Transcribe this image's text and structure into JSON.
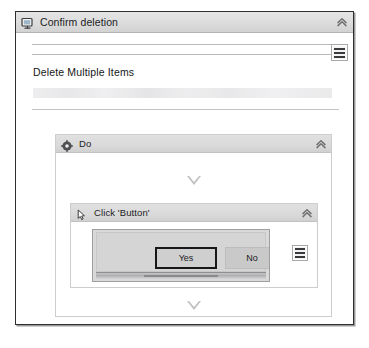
{
  "window": {
    "title": "Confirm deletion",
    "title_icon": "monitor-window-icon",
    "collapse_icon": "double-chevron-up-icon",
    "menu_icon": "hamburger-menu-icon"
  },
  "dialog": {
    "heading": "Delete Multiple Items",
    "description_placeholder": ""
  },
  "do_block": {
    "title": "Do",
    "icon": "move-gear-icon",
    "collapse_icon": "double-chevron-up-icon",
    "drop_indicator_upper": "drop-triangle-icon",
    "drop_indicator_lower": "drop-triangle-icon"
  },
  "click_block": {
    "title": "Click 'Button'",
    "icon": "mouse-cursor-icon",
    "collapse_icon": "double-chevron-up-icon",
    "menu_icon": "hamburger-menu-icon",
    "screenshot": {
      "buttons": [
        {
          "label": "Yes",
          "state": "focused"
        },
        {
          "label": "No",
          "state": "normal"
        }
      ]
    }
  },
  "colors": {
    "window_border": "#2e2e30",
    "titlebar": "#dcdcdc",
    "block_header": "#dadada",
    "focus_border": "#171719",
    "text": "#1b1b1d"
  }
}
